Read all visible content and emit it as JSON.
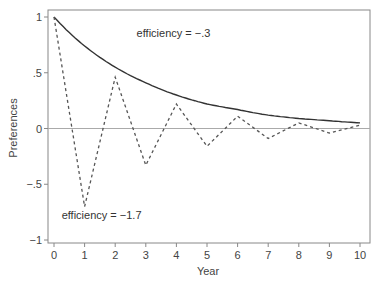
{
  "chart_data": {
    "type": "line",
    "title": "",
    "xlabel": "Year",
    "ylabel": "Preferences",
    "xlim": [
      0,
      10
    ],
    "ylim": [
      -1,
      1
    ],
    "x_ticks": [
      0,
      1,
      2,
      3,
      4,
      5,
      6,
      7,
      8,
      9,
      10
    ],
    "x_tick_labels": [
      "0",
      "1",
      "2",
      "3",
      "4",
      "5",
      "6",
      "7",
      "8",
      "9",
      "10"
    ],
    "y_ticks": [
      1,
      0.5,
      0,
      -0.5,
      -1
    ],
    "y_tick_labels": [
      "1",
      ".5",
      "0",
      "−.5",
      "−1"
    ],
    "grid": false,
    "reference_line": {
      "y": 0,
      "color": "#aaaaaa"
    },
    "x": [
      0,
      1,
      2,
      3,
      4,
      5,
      6,
      7,
      8,
      9,
      10
    ],
    "series": [
      {
        "name": "efficiency = −.3",
        "style": "solid",
        "color": "#333333",
        "values": [
          1.0,
          0.74,
          0.55,
          0.41,
          0.3,
          0.22,
          0.17,
          0.12,
          0.09,
          0.07,
          0.05
        ]
      },
      {
        "name": "efficiency = −1.7",
        "style": "dashed",
        "color": "#555555",
        "values": [
          1.0,
          -0.7,
          0.46,
          -0.33,
          0.22,
          -0.16,
          0.11,
          -0.09,
          0.05,
          -0.04,
          0.03
        ]
      }
    ],
    "annotations": [
      {
        "text": "efficiency = −.3",
        "x": 2.7,
        "y": 0.82
      },
      {
        "text": "efficiency = −1.7",
        "x": 0.25,
        "y": -0.81
      }
    ],
    "legend": "none (inline annotations)"
  }
}
